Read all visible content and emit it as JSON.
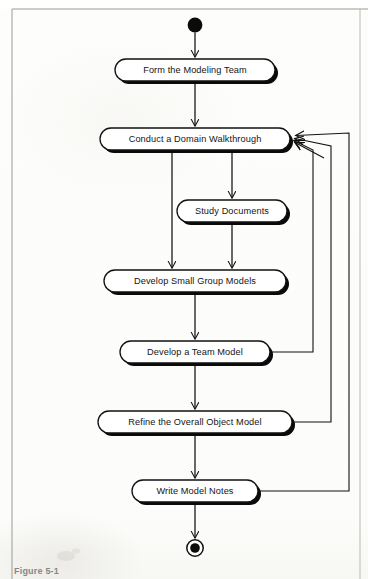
{
  "figure": {
    "caption": "Figure 5-1",
    "type": "uml-activity-diagram"
  },
  "diagram": {
    "start_node": "initial-state",
    "end_node": "final-state",
    "nodes": [
      {
        "id": "form-team",
        "label": "Form the Modeling Team",
        "cx": 195,
        "cy": 70,
        "w": 160,
        "h": 22
      },
      {
        "id": "domain-walk",
        "label": "Conduct a Domain Walkthrough",
        "cx": 195,
        "cy": 139,
        "w": 190,
        "h": 22
      },
      {
        "id": "study-docs",
        "label": "Study Documents",
        "cx": 232,
        "cy": 211,
        "w": 110,
        "h": 22
      },
      {
        "id": "small-group",
        "label": "Develop Small Group Models",
        "cx": 195,
        "cy": 281,
        "w": 182,
        "h": 22
      },
      {
        "id": "team-model",
        "label": "Develop a Team Model",
        "cx": 195,
        "cy": 352,
        "w": 150,
        "h": 22
      },
      {
        "id": "refine-model",
        "label": "Refine the Overall Object Model",
        "cx": 195,
        "cy": 422,
        "w": 194,
        "h": 22
      },
      {
        "id": "write-notes",
        "label": "Write Model Notes",
        "cx": 195,
        "cy": 491,
        "w": 126,
        "h": 22
      }
    ],
    "edges": [
      {
        "from": "start",
        "to": "form-team",
        "kind": "vertical"
      },
      {
        "from": "form-team",
        "to": "domain-walk",
        "kind": "vertical"
      },
      {
        "from": "domain-walk",
        "to": "study-docs",
        "kind": "fork-branch"
      },
      {
        "from": "domain-walk",
        "to": "small-group",
        "kind": "fork-branch"
      },
      {
        "from": "study-docs",
        "to": "small-group",
        "kind": "vertical"
      },
      {
        "from": "small-group",
        "to": "team-model",
        "kind": "vertical"
      },
      {
        "from": "team-model",
        "to": "refine-model",
        "kind": "vertical"
      },
      {
        "from": "refine-model",
        "to": "write-notes",
        "kind": "vertical"
      },
      {
        "from": "write-notes",
        "to": "end",
        "kind": "vertical"
      },
      {
        "from": "team-model",
        "to": "domain-walk",
        "kind": "feedback",
        "lane": 313
      },
      {
        "from": "refine-model",
        "to": "domain-walk",
        "kind": "feedback",
        "lane": 331
      },
      {
        "from": "write-notes",
        "to": "domain-walk",
        "kind": "feedback",
        "lane": 349
      }
    ]
  },
  "colors": {
    "stroke": "#111111",
    "node_fill": "#ffffff",
    "shadow": "#000000",
    "page_bg": "#fdfdfb",
    "caption_text": "#5d5d5d"
  }
}
